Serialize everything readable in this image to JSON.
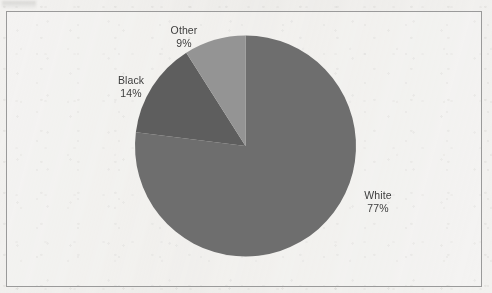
{
  "page": {
    "background_color": "#f2f1ef",
    "frame_border_color": "#9a9a9a",
    "scan_artifact": "faint-scan-smudge-top-left"
  },
  "chart_data": {
    "type": "pie",
    "title": "",
    "subtitle": "",
    "xlabel": "",
    "ylabel": "",
    "legend_position": "none",
    "labels_position": "outside",
    "start_angle_deg": 0,
    "direction": "clockwise",
    "categories": [
      "White",
      "Black",
      "Other"
    ],
    "values": [
      77,
      14,
      9
    ],
    "unit": "%",
    "colors": [
      "#6e6e6e",
      "#5e5e5e",
      "#949494"
    ],
    "slices": [
      {
        "name": "White",
        "value": 77,
        "value_label": "77%",
        "color": "#6e6e6e",
        "start_deg": 0,
        "sweep_deg": 277.2
      },
      {
        "name": "Black",
        "value": 14,
        "value_label": "14%",
        "color": "#5e5e5e",
        "start_deg": 277.2,
        "sweep_deg": 50.4
      },
      {
        "name": "Other",
        "value": 9,
        "value_label": "9%",
        "color": "#949494",
        "start_deg": 327.6,
        "sweep_deg": 32.4
      }
    ],
    "annotations": []
  }
}
